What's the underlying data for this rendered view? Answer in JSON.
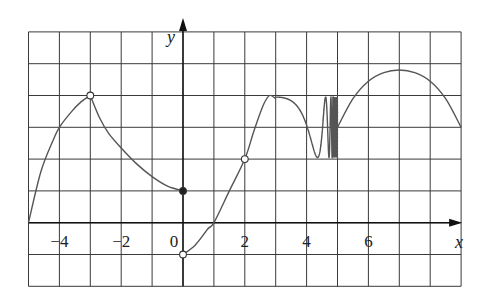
{
  "chart_data": {
    "type": "line",
    "title": "",
    "xlabel": "x",
    "ylabel": "y",
    "xlim": [
      -5,
      9
    ],
    "ylim": [
      -2,
      6
    ],
    "grid": true,
    "x_tick_labels": [
      {
        "value": -4,
        "label": "−4"
      },
      {
        "value": -2,
        "label": "−2"
      },
      {
        "value": 0,
        "label": "0"
      },
      {
        "value": 2,
        "label": "2"
      },
      {
        "value": 4,
        "label": "4"
      },
      {
        "value": 6,
        "label": "6"
      }
    ],
    "segments": [
      {
        "name": "left-rise",
        "points": [
          [
            -5,
            0
          ],
          [
            -4.6,
            1.6
          ],
          [
            -4.2,
            2.6
          ],
          [
            -4,
            3.0
          ],
          [
            -3.6,
            3.5
          ],
          [
            -3.3,
            3.8
          ],
          [
            -3,
            4
          ]
        ]
      },
      {
        "name": "decay",
        "points": [
          [
            -3,
            4
          ],
          [
            -2.7,
            3.3
          ],
          [
            -2.4,
            2.8
          ],
          [
            -2,
            2.35
          ],
          [
            -1.5,
            1.85
          ],
          [
            -1,
            1.45
          ],
          [
            -0.5,
            1.15
          ],
          [
            0,
            1
          ]
        ]
      },
      {
        "name": "rise-through-origin-region",
        "points": [
          [
            0,
            -1
          ],
          [
            0.4,
            -0.7
          ],
          [
            0.8,
            -0.2
          ],
          [
            1,
            0
          ],
          [
            1.5,
            1
          ],
          [
            2,
            2
          ],
          [
            2.3,
            2.9
          ],
          [
            2.6,
            3.7
          ],
          [
            2.8,
            4
          ],
          [
            3.0,
            3.9
          ]
        ]
      },
      {
        "name": "oscillation",
        "x_range": [
          3.0,
          5.0
        ],
        "center": 3,
        "amplitude": 1,
        "description": "y = 3 + sin(k/(5-x)) oscillating between 2 and 4 with increasing frequency toward x=5"
      },
      {
        "name": "right-arc",
        "points": [
          [
            5,
            3
          ],
          [
            5.5,
            3.9
          ],
          [
            6,
            4.45
          ],
          [
            6.5,
            4.72
          ],
          [
            7,
            4.8
          ],
          [
            7.5,
            4.72
          ],
          [
            8,
            4.45
          ],
          [
            8.5,
            3.9
          ],
          [
            9,
            3
          ]
        ]
      }
    ],
    "markers": [
      {
        "x": -3,
        "y": 4,
        "style": "open"
      },
      {
        "x": 0,
        "y": 1,
        "style": "filled"
      },
      {
        "x": 0,
        "y": -1,
        "style": "open"
      },
      {
        "x": 2,
        "y": 2,
        "style": "open"
      }
    ],
    "annotations": [
      {
        "type": "dotted-vertical",
        "x": 5,
        "y_range": [
          2,
          4
        ]
      }
    ]
  },
  "layout": {
    "origin_px": [
      183,
      222.7
    ],
    "unit_x_px": 30.9,
    "unit_y_px": 31.8,
    "grid_color": "#3a3a3a",
    "curve_color": "#555555"
  }
}
